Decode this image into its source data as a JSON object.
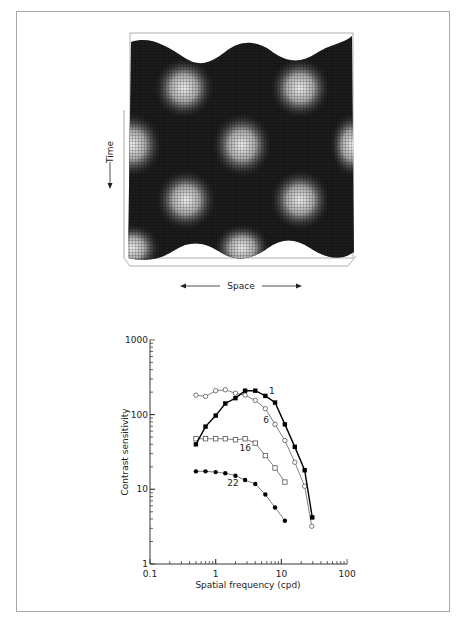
{
  "figure": {
    "surface_plot": {
      "x_label": "Space",
      "y_label": "Time",
      "description": "Spatiotemporal sinusoidal luminance surface (counterphase grating)"
    }
  },
  "chart_data": {
    "type": "line",
    "title": "",
    "xlabel": "Spatial frequency (cpd)",
    "ylabel": "Contrast sensitivity",
    "xscale": "log",
    "yscale": "log",
    "xlim": [
      0.1,
      100
    ],
    "ylim": [
      1,
      1000
    ],
    "x_ticks": [
      "0.1",
      "1",
      "10",
      "100"
    ],
    "y_ticks": [
      "1",
      "10",
      "100",
      "1000"
    ],
    "grid": false,
    "legend": "inline labels",
    "series": [
      {
        "name": "1",
        "marker": "filled-square",
        "line_color": "#000000",
        "x": [
          0.5,
          0.7,
          1.0,
          1.4,
          2.0,
          2.8,
          4.0,
          5.7,
          8.0,
          11.3,
          16.0,
          22.6,
          29.5
        ],
        "values": [
          40,
          69,
          97,
          141,
          166,
          209,
          209,
          178,
          145,
          74,
          37,
          18,
          4.2
        ]
      },
      {
        "name": "6",
        "marker": "open-circle",
        "line_color": "#808080",
        "x": [
          0.5,
          0.7,
          1.0,
          1.4,
          2.0,
          2.8,
          4.0,
          5.7,
          8.0,
          11.3,
          16.0,
          22.6,
          29.0
        ],
        "values": [
          182,
          175,
          209,
          215,
          193,
          182,
          155,
          120,
          74,
          45,
          23,
          11,
          3.2
        ]
      },
      {
        "name": "16",
        "marker": "open-square",
        "line_color": "#808080",
        "x": [
          0.5,
          0.7,
          1.0,
          1.4,
          2.0,
          2.8,
          4.0,
          5.7,
          8.0,
          11.3
        ],
        "values": [
          47.5,
          47.5,
          47.5,
          47.5,
          46,
          47.5,
          41.5,
          28.3,
          19.3,
          12.5
        ]
      },
      {
        "name": "22",
        "marker": "filled-circle",
        "line_color": "#808080",
        "x": [
          0.5,
          0.7,
          1.0,
          1.4,
          2.0,
          2.8,
          4.0,
          5.7,
          8.0,
          11.3
        ],
        "values": [
          17.4,
          17.4,
          17.0,
          16.4,
          15.2,
          13.3,
          11.8,
          8.5,
          5.7,
          3.8
        ]
      }
    ],
    "annotations": [
      {
        "text": "1",
        "x": 6.5,
        "y": 190
      },
      {
        "text": "6",
        "x": 5.3,
        "y": 78
      },
      {
        "text": "16",
        "x": 2.3,
        "y": 33
      },
      {
        "text": "22",
        "x": 1.5,
        "y": 11
      }
    ]
  }
}
